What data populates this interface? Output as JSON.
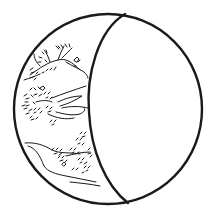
{
  "image": {
    "subject": "line drawing of a sphere with a landscape painted on its left crescent",
    "colors": {
      "background": "#ffffff",
      "ink": "#1a1a1a"
    },
    "elements": [
      "outer-circle",
      "front-ellipse-face",
      "upper-tree-branches",
      "middle-shrubs-and-ridges",
      "lower-shore-and-foliage"
    ]
  }
}
